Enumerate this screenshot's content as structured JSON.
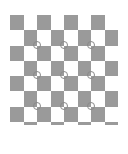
{
  "image": {
    "description": "Checkerboard calibration pattern with small circle markers at interior corners",
    "square_color": "#9a9a9a",
    "background_color": "#ffffff",
    "ring_color": "#8a8a8a"
  },
  "grid": {
    "left": 10,
    "top": 15,
    "cols": 8,
    "rows": 8,
    "cell_w": 13.5,
    "cell_h": 15.25,
    "last_row_strip_h": 3
  },
  "markers": [
    {
      "x": 37,
      "y": 45
    },
    {
      "x": 64,
      "y": 45
    },
    {
      "x": 91,
      "y": 45
    },
    {
      "x": 37,
      "y": 75
    },
    {
      "x": 64,
      "y": 75
    },
    {
      "x": 91,
      "y": 75
    },
    {
      "x": 37,
      "y": 106
    },
    {
      "x": 64,
      "y": 106
    },
    {
      "x": 91,
      "y": 106
    }
  ]
}
